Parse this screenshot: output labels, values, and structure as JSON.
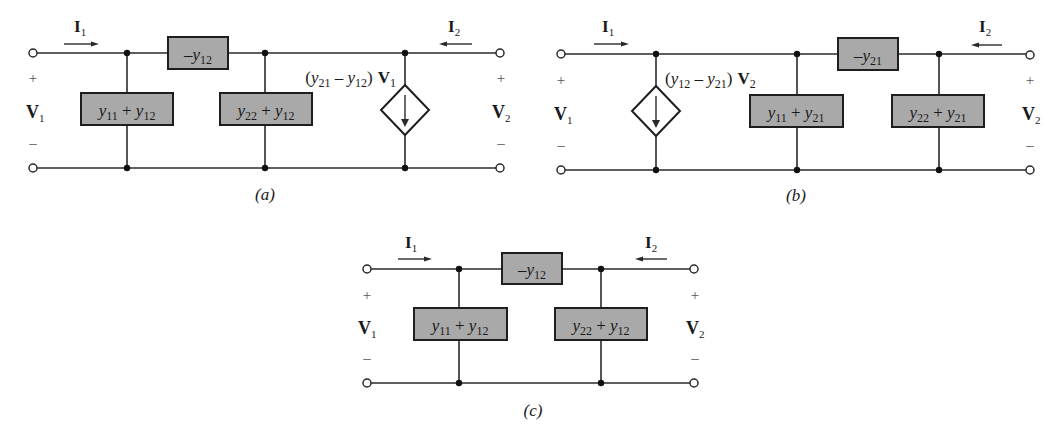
{
  "figure": {
    "circuits": [
      {
        "id": "a",
        "caption": "(a)",
        "port1": {
          "current": "I",
          "current_sub": "1",
          "voltage": "V",
          "voltage_sub": "1",
          "plus": "+",
          "minus": "–"
        },
        "port2": {
          "current": "I",
          "current_sub": "2",
          "voltage": "V",
          "voltage_sub": "2",
          "plus": "+",
          "minus": "–"
        },
        "series_element": {
          "prefix": "–y",
          "sub": "12"
        },
        "shunt_left": {
          "a": "y",
          "a_sub": "11",
          "op": " + ",
          "b": "y",
          "b_sub": "12"
        },
        "shunt_right": {
          "a": "y",
          "a_sub": "22",
          "op": " + ",
          "b": "y",
          "b_sub": "12"
        },
        "dependent_source": {
          "label_open": "(",
          "a": "y",
          "a_sub": "21",
          "op": " – ",
          "b": "y",
          "b_sub": "12",
          "label_close": ")",
          "ctrl": "V",
          "ctrl_sub": "1",
          "side": "right"
        }
      },
      {
        "id": "b",
        "caption": "(b)",
        "port1": {
          "current": "I",
          "current_sub": "1",
          "voltage": "V",
          "voltage_sub": "1",
          "plus": "+",
          "minus": "–"
        },
        "port2": {
          "current": "I",
          "current_sub": "2",
          "voltage": "V",
          "voltage_sub": "2",
          "plus": "+",
          "minus": "–"
        },
        "series_element": {
          "prefix": "–y",
          "sub": "21"
        },
        "shunt_left": {
          "a": "y",
          "a_sub": "11",
          "op": " + ",
          "b": "y",
          "b_sub": "21"
        },
        "shunt_right": {
          "a": "y",
          "a_sub": "22",
          "op": " + ",
          "b": "y",
          "b_sub": "21"
        },
        "dependent_source": {
          "label_open": "(",
          "a": "y",
          "a_sub": "12",
          "op": " – ",
          "b": "y",
          "b_sub": "21",
          "label_close": ")",
          "ctrl": "V",
          "ctrl_sub": "2",
          "side": "left"
        }
      },
      {
        "id": "c",
        "caption": "(c)",
        "port1": {
          "current": "I",
          "current_sub": "1",
          "voltage": "V",
          "voltage_sub": "1",
          "plus": "+",
          "minus": "–"
        },
        "port2": {
          "current": "I",
          "current_sub": "2",
          "voltage": "V",
          "voltage_sub": "2",
          "plus": "+",
          "minus": "–"
        },
        "series_element": {
          "prefix": "–y",
          "sub": "12"
        },
        "shunt_left": {
          "a": "y",
          "a_sub": "11",
          "op": " + ",
          "b": "y",
          "b_sub": "12"
        },
        "shunt_right": {
          "a": "y",
          "a_sub": "22",
          "op": " + ",
          "b": "y",
          "b_sub": "12"
        }
      }
    ],
    "colors": {
      "element_fill": "#a9a9a9",
      "wire": "#2a2a2a",
      "background": "#ffffff"
    }
  }
}
